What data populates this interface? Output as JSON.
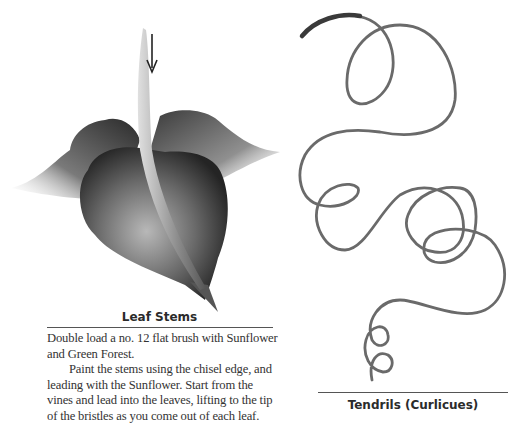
{
  "figures": {
    "leaf": {
      "icon": "leaf-stem-illustration",
      "arrow": "down-arrow",
      "caption": "Leaf Stems"
    },
    "tendrils": {
      "icon": "tendril-curlicue-illustration",
      "caption": "Tendrils (Curlicues)"
    }
  },
  "instructions": {
    "paragraphs": [
      "Double load a no. 12 flat brush with Sunflower and Green Forest.",
      "Paint the stems using the chisel edge, and leading with the Sunflower. Start from the vines and lead into the leaves, lifting to the tip of the bristles as you come out of each leaf."
    ]
  },
  "colors": {
    "text": "#333333",
    "stroke": "#5a5a5a",
    "leaf_dark": "#2e2e2e"
  }
}
